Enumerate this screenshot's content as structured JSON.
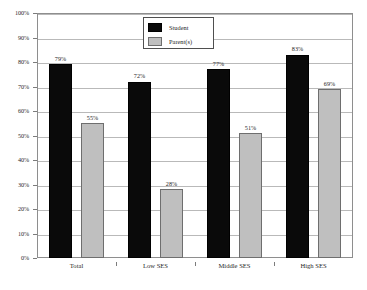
{
  "chart_data": {
    "type": "bar",
    "title": "",
    "subtitle": "",
    "xlabel": "",
    "ylabel": "",
    "categories": [
      "Total",
      "Low SES",
      "Middle SES",
      "High SES"
    ],
    "series": [
      {
        "name": "Student",
        "color": "#0A0A0A",
        "values": [
          79,
          72,
          77,
          83
        ]
      },
      {
        "name": "Parent(s)",
        "color": "#BFBFBF",
        "values": [
          55,
          28,
          51,
          69
        ]
      }
    ],
    "value_labels": [
      [
        "79%",
        "72%",
        "77%",
        "83%"
      ],
      [
        "55%",
        "28%",
        "51%",
        "69%"
      ]
    ],
    "ylim": [
      0,
      100
    ],
    "y_tick_values": [
      0,
      10,
      20,
      30,
      40,
      50,
      60,
      70,
      80,
      90,
      100
    ],
    "y_tick_labels": [
      "0%",
      "10%",
      "20%",
      "30%",
      "40%",
      "50%",
      "60%",
      "70%",
      "80%",
      "90%",
      "100%"
    ],
    "grid": true,
    "grid_axis": "y",
    "legend_position": "upper-center-left",
    "value_labels_shown": true,
    "unit": "%"
  },
  "legend": {
    "entries": [
      {
        "label": "Student",
        "color": "#0A0A0A"
      },
      {
        "label": "Parent(s)",
        "color": "#BFBFBF"
      }
    ]
  }
}
